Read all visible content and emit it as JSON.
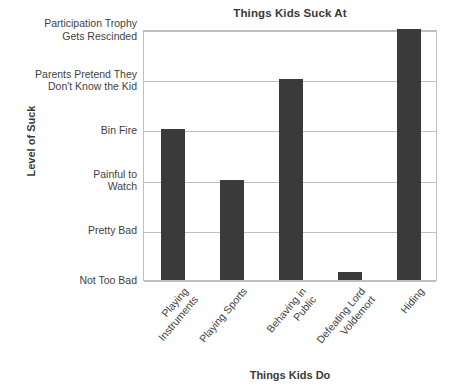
{
  "chart_data": {
    "type": "bar",
    "title": "Things Kids Suck At",
    "xlabel": "Things Kids Do",
    "ylabel": "Level of Suck",
    "categories": [
      "Playing\nInstruments",
      "Playing Sports",
      "Behaving in\nPublic",
      "Defeating Lord\nVoldemort",
      "Hiding"
    ],
    "values": [
      3,
      2,
      4,
      0.15,
      5
    ],
    "y_tick_labels": [
      "Not Too Bad",
      "Pretty Bad",
      "Painful to\nWatch",
      "Bin Fire",
      "Parents Pretend They\nDon't Know the Kid",
      "Participation Trophy\nGets Rescinded"
    ],
    "ylim": [
      0,
      5
    ],
    "grid": true,
    "legend": false,
    "bar_color": "#3a3a3a",
    "grid_color": "#bfbfbf",
    "background_color": "#ffffff"
  }
}
